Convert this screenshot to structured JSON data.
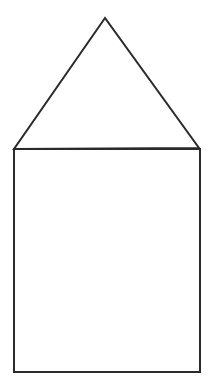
{
  "figure": {
    "stroke_color": "#2a2a2a",
    "background": "#ffffff",
    "shapes": {
      "roof": {
        "type": "triangle",
        "points": "105,18 14,149 199,148"
      },
      "body": {
        "type": "rectangle",
        "x": 14,
        "y": 149,
        "width": 186,
        "height": 223
      }
    }
  }
}
